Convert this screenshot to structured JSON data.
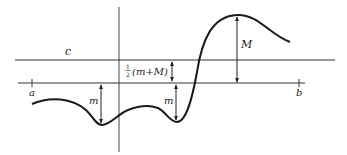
{
  "figure": {
    "labels": {
      "c": "c",
      "a": "a",
      "b": "b",
      "M": "M",
      "m_left": "m",
      "m_right": "m",
      "half_num": "1",
      "half_den": "2",
      "half_expr": "(m+M)"
    },
    "colors": {
      "ink": "#222222",
      "background": "#ffffff"
    }
  }
}
